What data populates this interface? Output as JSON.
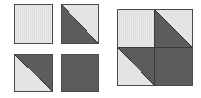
{
  "diagram": {
    "colors": {
      "light": "#e4e4e4",
      "dark": "#5c5c5c",
      "border": "#4a4a4a"
    },
    "pieces": [
      {
        "id": "piece-1",
        "type": "solid",
        "fill": "light"
      },
      {
        "id": "piece-2",
        "type": "half-square-triangle",
        "split": "top-left to bottom-right",
        "top_right": "light",
        "bottom_left": "dark"
      },
      {
        "id": "piece-3",
        "type": "half-square-triangle",
        "split": "top-left to bottom-right",
        "top_right": "dark",
        "bottom_left": "light"
      },
      {
        "id": "piece-4",
        "type": "solid",
        "fill": "dark"
      }
    ],
    "assembled_block": {
      "grid": "2x2",
      "cells": [
        "piece-1",
        "piece-2",
        "piece-3",
        "piece-4"
      ]
    }
  }
}
